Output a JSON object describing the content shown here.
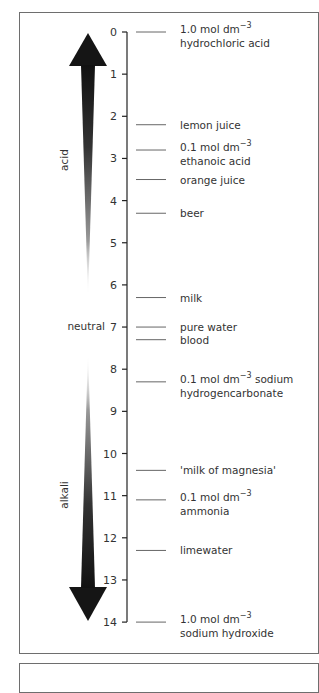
{
  "chart_data": {
    "type": "scale",
    "axis": {
      "label": "pH",
      "min": 0,
      "max": 14,
      "ticks": [
        0,
        1,
        2,
        3,
        4,
        5,
        6,
        7,
        8,
        9,
        10,
        11,
        12,
        13,
        14
      ]
    },
    "regions": [
      {
        "name": "acid",
        "direction": "up",
        "from": 7,
        "to": 0
      },
      {
        "name": "neutral",
        "at": 7
      },
      {
        "name": "alkali",
        "direction": "down",
        "from": 7,
        "to": 14
      }
    ],
    "points": [
      {
        "ph": 0.0,
        "line1": "1.0 mol dm",
        "sup": "−3",
        "line2": "hydrochloric acid"
      },
      {
        "ph": 2.2,
        "line1": "lemon juice"
      },
      {
        "ph": 2.8,
        "line1": "0.1 mol dm",
        "sup": "−3",
        "line2": "ethanoic acid"
      },
      {
        "ph": 3.5,
        "line1": "orange juice"
      },
      {
        "ph": 4.3,
        "line1": "beer"
      },
      {
        "ph": 6.3,
        "line1": "milk"
      },
      {
        "ph": 7.0,
        "line1": "pure water"
      },
      {
        "ph": 7.3,
        "line1": "blood"
      },
      {
        "ph": 8.3,
        "line1": "0.1 mol dm",
        "sup": "−3",
        "line1_suffix": "sodium",
        "line2": "hydrogencarbonate"
      },
      {
        "ph": 10.4,
        "line1": "'milk of magnesia'"
      },
      {
        "ph": 11.1,
        "line1": "0.1 mol dm",
        "sup": "−3",
        "line2": "ammonia"
      },
      {
        "ph": 12.3,
        "line1": "limewater"
      },
      {
        "ph": 14.0,
        "line1": "1.0 mol dm",
        "sup": "−3",
        "line2": "sodium hydroxide"
      }
    ]
  },
  "labels": {
    "acid": "acid",
    "neutral": "neutral",
    "alkali": "alkali"
  },
  "ticks": [
    "0",
    "1",
    "2",
    "3",
    "4",
    "5",
    "6",
    "7",
    "8",
    "9",
    "10",
    "11",
    "12",
    "13",
    "14"
  ],
  "items": [
    {
      "line1": "1.0 mol dm",
      "sup": "−3",
      "line2": "hydrochloric acid"
    },
    {
      "line1": "lemon juice"
    },
    {
      "line1": "0.1 mol dm",
      "sup": "−3",
      "line2": "ethanoic acid"
    },
    {
      "line1": "orange juice"
    },
    {
      "line1": "beer"
    },
    {
      "line1": "milk"
    },
    {
      "line1": "pure water"
    },
    {
      "line1": "blood"
    },
    {
      "line1": "0.1 mol dm",
      "sup": "−3",
      "suffix": " sodium",
      "line2": "hydrogencarbonate"
    },
    {
      "line1": "'milk of magnesia'"
    },
    {
      "line1": "0.1 mol dm",
      "sup": "−3",
      "line2": "ammonia"
    },
    {
      "line1": "limewater"
    },
    {
      "line1": "1.0 mol dm",
      "sup": "−3",
      "line2": "sodium hydroxide"
    }
  ]
}
